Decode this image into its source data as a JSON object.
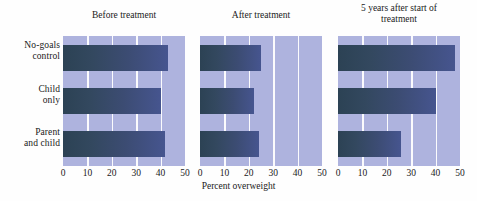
{
  "chart_data": {
    "type": "bar",
    "title": "",
    "xlabel": "Percent overweight",
    "ylabel": "",
    "orientation": "horizontal",
    "xlim": [
      0,
      50
    ],
    "xticks": [
      0,
      10,
      20,
      30,
      40,
      50
    ],
    "grid": true,
    "legend": "none",
    "categories": [
      "No-goals control",
      "Child only",
      "Parent and child"
    ],
    "panels": [
      {
        "title": "Before treatment",
        "values": [
          43,
          40,
          42
        ]
      },
      {
        "title": "After treatment",
        "values": [
          25,
          22,
          24
        ]
      },
      {
        "title": "5 years after start of treatment",
        "values": [
          48,
          40,
          26
        ]
      }
    ],
    "colors": {
      "plot_background": "#aeb3de",
      "gridline": "#fbfbfd",
      "bar_start": "#2c4254",
      "bar_end": "#46558f",
      "figure_background": "#fefefe",
      "text": "#1a1a1a"
    }
  },
  "category_labels": [
    {
      "line1": "No-goals",
      "line2": "control"
    },
    {
      "line1": "Child",
      "line2": "only"
    },
    {
      "line1": "Parent",
      "line2": "and child"
    }
  ],
  "panel_titles": [
    {
      "line1": "Before treatment",
      "line2": ""
    },
    {
      "line1": "After treatment",
      "line2": ""
    },
    {
      "line1": "5 years after start of",
      "line2": "treatment"
    }
  ],
  "xticks": [
    "0",
    "10",
    "20",
    "30",
    "40",
    "50"
  ],
  "xlabel": "Percent overweight"
}
